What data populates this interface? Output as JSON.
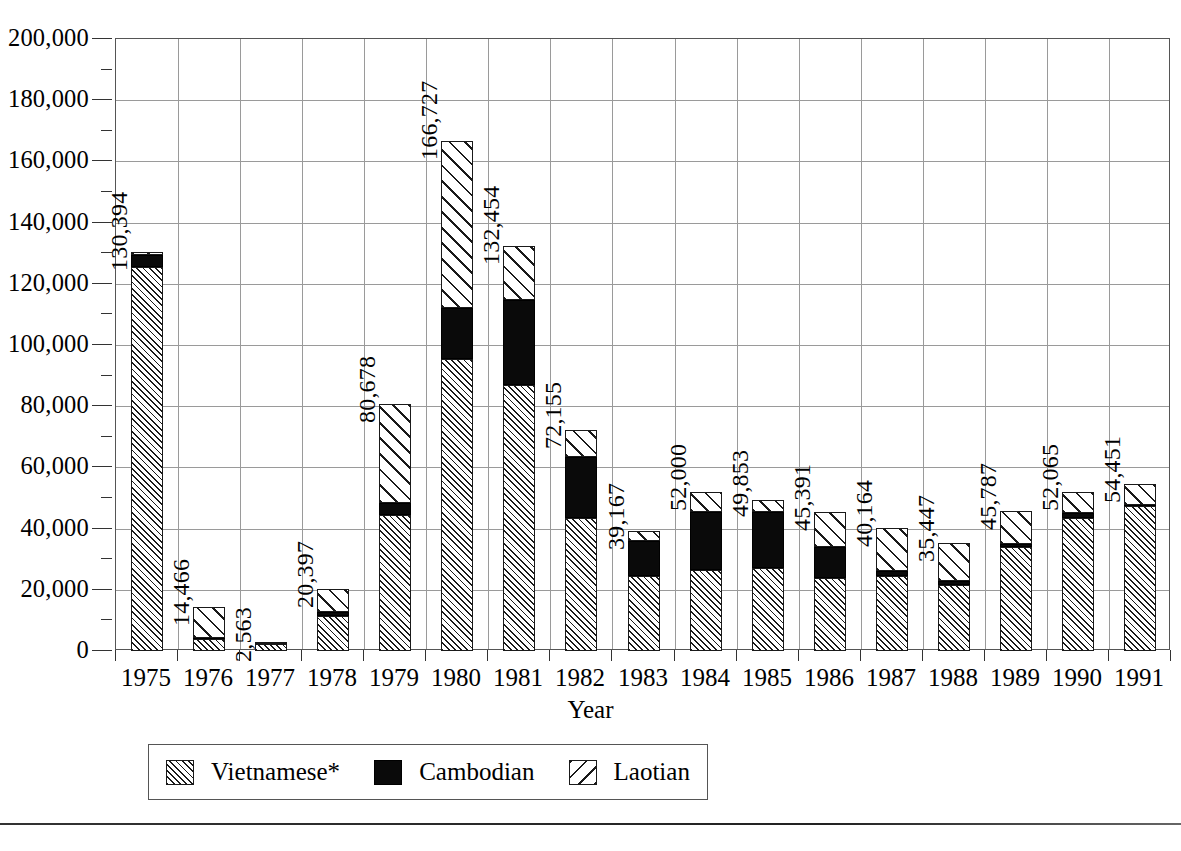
{
  "chart_data": {
    "type": "bar",
    "subtype": "stacked",
    "title": "",
    "xlabel": "Year",
    "ylabel": "",
    "ylim": [
      0,
      200000
    ],
    "ytick_step": 20000,
    "yminor_step": 10000,
    "grid": true,
    "legend_position": "bottom",
    "ytick_labels": [
      "0",
      "20,000",
      "40,000",
      "60,000",
      "80,000",
      "100,000",
      "120,000",
      "140,000",
      "160,000",
      "180,000",
      "200,000"
    ],
    "ytick_values": [
      0,
      20000,
      40000,
      60000,
      80000,
      100000,
      120000,
      140000,
      160000,
      180000,
      200000
    ],
    "categories": [
      "1975",
      "1976",
      "1977",
      "1978",
      "1979",
      "1980",
      "1981",
      "1982",
      "1983",
      "1984",
      "1985",
      "1986",
      "1987",
      "1988",
      "1989",
      "1990",
      "1991"
    ],
    "series": [
      {
        "name": "Vietnamese*",
        "pattern": "dense-hatch",
        "values": [
          125500,
          3900,
          2200,
          11500,
          44500,
          95500,
          86800,
          43500,
          24500,
          26500,
          27000,
          24000,
          24500,
          21500,
          34000,
          43500,
          47500
        ]
      },
      {
        "name": "Cambodian",
        "pattern": "solid-black",
        "values": [
          4000,
          400,
          150,
          1100,
          3800,
          16500,
          28000,
          20000,
          11500,
          19000,
          18500,
          10000,
          1500,
          1500,
          1000,
          1500,
          300
        ]
      },
      {
        "name": "Laotian",
        "pattern": "coarse-hatch",
        "values": [
          894,
          10166,
          213,
          7797,
          32378,
          54727,
          17654,
          8655,
          3167,
          6500,
          3853,
          11391,
          14164,
          12447,
          10787,
          7065,
          6651
        ]
      }
    ],
    "totals": [
      130394,
      14466,
      2563,
      20397,
      80678,
      166727,
      132454,
      72155,
      39167,
      52000,
      49853,
      45391,
      40164,
      35447,
      45787,
      52065,
      54451
    ],
    "total_labels": [
      "130,394",
      "14,466",
      "2,563",
      "20,397",
      "80,678",
      "166,727",
      "132,454",
      "72,155",
      "39,167",
      "52,000",
      "49,853",
      "45,391",
      "40,164",
      "35,447",
      "45,787",
      "52,065",
      "54,451"
    ]
  },
  "legend": {
    "items": [
      {
        "label": "Vietnamese*",
        "swatch": "dense-hatch-swatch"
      },
      {
        "label": "Cambodian",
        "swatch": "solid-black-swatch"
      },
      {
        "label": "Laotian",
        "swatch": "coarse-hatch-swatch"
      }
    ]
  },
  "axis": {
    "x_title": "Year"
  },
  "footnote": ""
}
